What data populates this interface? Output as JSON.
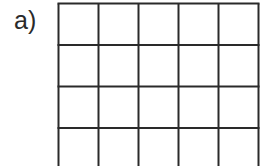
{
  "figure": {
    "label": "a)",
    "grid": {
      "columns": 5,
      "rows_visible": 4,
      "cell_width": 40,
      "cell_height": 41.5,
      "line_color": "#2a2a2a",
      "line_width": 2,
      "cells_filled": []
    }
  }
}
